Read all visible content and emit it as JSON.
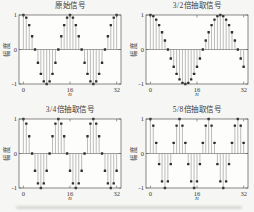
{
  "figure": {
    "background": "#f6f6f4",
    "plot_background": "#fdfdfc",
    "axis_color": "#565656",
    "stem_color": "#999999",
    "marker_color": "#2d2d2d",
    "text_color": "#3a3a3a",
    "caption_smudge_color": "#d6d6d3"
  },
  "chart_data": [
    {
      "type": "stem",
      "title": "原始信号",
      "xlabel": "n",
      "ylabel": "幅度",
      "xlim": [
        -1.5,
        33.5
      ],
      "ylim": [
        -1,
        1
      ],
      "xticks": [
        0,
        16,
        32
      ],
      "yticks": [
        1,
        0,
        -1
      ],
      "x": [
        0,
        1,
        2,
        3,
        4,
        5,
        6,
        7,
        8,
        9,
        10,
        11,
        12,
        13,
        14,
        15,
        16,
        17,
        18,
        19,
        20,
        21,
        22,
        23,
        24,
        25,
        26,
        27,
        28,
        29,
        30,
        31,
        32
      ],
      "y": [
        1,
        0.924,
        0.707,
        0.383,
        0,
        -0.383,
        -0.707,
        -0.924,
        -1,
        -0.924,
        -0.707,
        -0.383,
        0,
        0.383,
        0.707,
        0.924,
        1,
        0.924,
        0.707,
        0.383,
        0,
        -0.383,
        -0.707,
        -0.924,
        -1,
        -0.924,
        -0.707,
        -0.383,
        0,
        0.383,
        0.707,
        0.924,
        1
      ]
    },
    {
      "type": "stem",
      "title": "3/2倍抽取信号",
      "xlabel": "n",
      "ylabel": "幅度",
      "xlim": [
        -1.5,
        33.5
      ],
      "ylim": [
        -1,
        1
      ],
      "xticks": [
        0,
        16,
        32
      ],
      "yticks": [
        1,
        0,
        -1
      ],
      "x": [
        0,
        1,
        2,
        3,
        4,
        5,
        6,
        7,
        8,
        9,
        10,
        11,
        12,
        13,
        14,
        15,
        16,
        17,
        18,
        19,
        20,
        21,
        22,
        23,
        24,
        25,
        26,
        27,
        28,
        29,
        30,
        31,
        32
      ],
      "y": [
        1,
        0.966,
        0.866,
        0.707,
        0.5,
        0.259,
        0,
        -0.259,
        -0.5,
        -0.707,
        -0.866,
        -0.966,
        -1,
        -0.966,
        -0.866,
        -0.707,
        -0.5,
        -0.259,
        0,
        0.259,
        0.5,
        0.707,
        0.866,
        0.966,
        1,
        0.966,
        0.866,
        0.707,
        0.5,
        0.259,
        0,
        -0.259,
        -0.5
      ]
    },
    {
      "type": "stem",
      "title": "3/4倍抽取信号",
      "xlabel": "n",
      "ylabel": "幅度",
      "xlim": [
        -1.5,
        33.5
      ],
      "ylim": [
        -1,
        1
      ],
      "xticks": [
        0,
        16,
        32
      ],
      "yticks": [
        1,
        0,
        -1
      ],
      "x": [
        0,
        1,
        2,
        3,
        4,
        5,
        6,
        7,
        8,
        9,
        10,
        11,
        12,
        13,
        14,
        15,
        16,
        17,
        18,
        19,
        20,
        21,
        22,
        23,
        24,
        25,
        26,
        27,
        28,
        29,
        30,
        31,
        32
      ],
      "y": [
        1,
        0.866,
        0.5,
        0,
        -0.5,
        -0.866,
        -1,
        -0.866,
        -0.5,
        0,
        0.5,
        0.866,
        1,
        0.866,
        0.5,
        0,
        -0.5,
        -0.866,
        -1,
        -0.866,
        -0.5,
        0,
        0.5,
        0.866,
        1,
        0.866,
        0.5,
        0,
        -0.5,
        -0.866,
        -1,
        -0.866,
        -0.5
      ]
    },
    {
      "type": "stem",
      "title": "5/8倍抽取信号",
      "xlabel": "n",
      "ylabel": "幅度",
      "xlim": [
        -1.5,
        33.5
      ],
      "ylim": [
        -1,
        1
      ],
      "xticks": [
        0,
        16,
        32
      ],
      "yticks": [
        1,
        0,
        -1
      ],
      "x": [
        0,
        1,
        2,
        3,
        4,
        5,
        6,
        7,
        8,
        9,
        10,
        11,
        12,
        13,
        14,
        15,
        16,
        17,
        18,
        19,
        20,
        21,
        22,
        23,
        24,
        25,
        26,
        27,
        28,
        29,
        30,
        31,
        32
      ],
      "y": [
        1,
        0.809,
        0.309,
        -0.309,
        -0.809,
        -1,
        -0.809,
        -0.309,
        0.309,
        0.809,
        1,
        0.809,
        0.309,
        -0.309,
        -0.809,
        -1,
        -0.809,
        -0.309,
        0.309,
        0.809,
        1,
        0.809,
        0.309,
        -0.309,
        -0.809,
        -1,
        -0.809,
        -0.309,
        0.309,
        0.809,
        1,
        0.809,
        0.309
      ]
    }
  ]
}
